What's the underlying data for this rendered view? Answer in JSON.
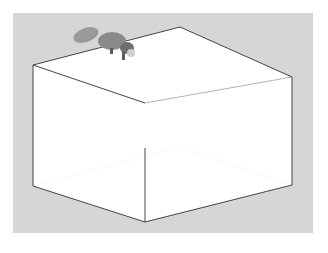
{
  "chart_data": {
    "type": "surface",
    "title": "",
    "function": "peaks",
    "formula": "3(1-x)^2 e^(-x^2-(y+1)^2) - 10(x/5 - x^3 - y^5) e^(-x^2-y^2) - 1/3 e^(-(x+1)^2-y^2)",
    "x": {
      "range": [
        -3,
        3
      ],
      "ticks": [
        -3,
        -2,
        -1,
        0,
        1,
        2,
        3
      ]
    },
    "y": {
      "range": [
        -3,
        3
      ],
      "ticks": [
        -2,
        0,
        2
      ]
    },
    "z": {
      "range": [
        -10,
        10
      ],
      "ticks": [
        -5,
        0,
        5
      ]
    },
    "grid": true,
    "mesh_resolution": 31,
    "annotation": "red panda image sitting on top of the main peak",
    "colors": {
      "background": "#d6d6d6",
      "axes_face": "#ffffff",
      "surface": "#c8c8c8",
      "mesh": "#555555",
      "box": "#444444"
    }
  },
  "labels": {
    "x_ticks": [
      "-3",
      "-2",
      "-1",
      "0",
      "1",
      "2",
      "3"
    ],
    "y_ticks": [
      "2",
      "0",
      "-2"
    ],
    "z_ticks": [
      "5",
      "0",
      "-5"
    ]
  }
}
